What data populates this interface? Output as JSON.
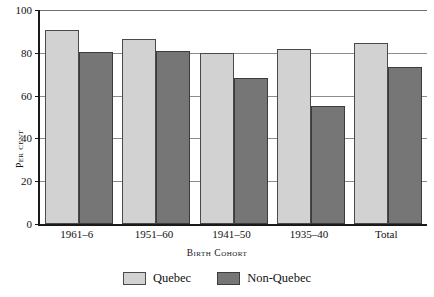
{
  "chart_data": {
    "type": "bar",
    "title": "",
    "xlabel": "Birth Cohort",
    "ylabel": "Per cent",
    "ylim": [
      0,
      100
    ],
    "yticks": [
      0,
      20,
      40,
      60,
      80,
      100
    ],
    "grid": "horizontal",
    "legend_position": "bottom-center",
    "categories": [
      "1961–6",
      "1951–60",
      "1941–50",
      "1935–40",
      "Total"
    ],
    "series": [
      {
        "name": "Quebec",
        "color": "#d2d2d2",
        "values": [
          90.5,
          86.5,
          80.0,
          82.0,
          84.5
        ]
      },
      {
        "name": "Non-Quebec",
        "color": "#767676",
        "values": [
          80.5,
          81.0,
          68.0,
          55.0,
          73.5
        ]
      }
    ]
  },
  "axes": {
    "y_tick_labels": [
      "0",
      "20",
      "40",
      "60",
      "80",
      "100"
    ],
    "y_axis_title": "Per cent",
    "x_tick_labels": [
      "1961–6",
      "1951–60",
      "1941–50",
      "1935–40",
      "Total"
    ],
    "x_axis_title": "Birth Cohort"
  },
  "legend": {
    "items": [
      {
        "label": "Quebec"
      },
      {
        "label": "Non-Quebec"
      }
    ]
  }
}
